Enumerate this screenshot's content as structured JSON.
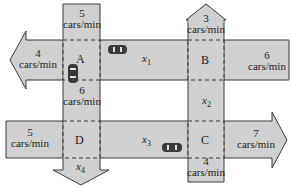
{
  "diagram": {
    "type": "traffic-flow-network",
    "colors": {
      "road_fill": "#d0d0d0",
      "road_stroke": "#3a3a3a",
      "dash": "#3a3a3a",
      "car_fill": "#3a3a3a",
      "background": "#ffffff"
    },
    "intersections": [
      {
        "id": "A",
        "label": "A"
      },
      {
        "id": "B",
        "label": "B"
      },
      {
        "id": "C",
        "label": "C"
      },
      {
        "id": "D",
        "label": "D"
      }
    ],
    "flows": {
      "top_into_A": {
        "value": "5",
        "unit": "cars/min"
      },
      "west_out_A": {
        "value": "4",
        "unit": "cars/min"
      },
      "A_south": {
        "value": "6",
        "unit": "cars/min"
      },
      "north_out_B": {
        "value": "3",
        "unit": "cars/min"
      },
      "east_into_B": {
        "value": "6",
        "unit": "cars/min"
      },
      "west_into_D": {
        "value": "5",
        "unit": "cars/min"
      },
      "east_out_C": {
        "value": "7",
        "unit": "cars/min"
      },
      "bottom_into_C": {
        "value": "4",
        "unit": "cars/min"
      }
    },
    "variables": {
      "x1": {
        "base": "x",
        "sub": "1"
      },
      "x2": {
        "base": "x",
        "sub": "2"
      },
      "x3": {
        "base": "x",
        "sub": "3"
      },
      "x4": {
        "base": "x",
        "sub": "4"
      }
    }
  }
}
